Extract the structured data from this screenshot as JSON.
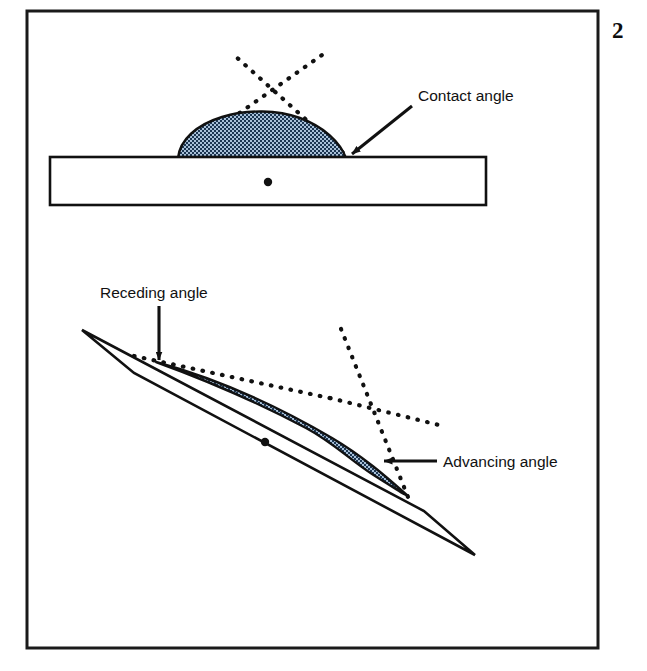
{
  "figure": {
    "number": "2",
    "frame": {
      "x": 27,
      "y": 11,
      "width": 571,
      "height": 637,
      "stroke_color": "#1a1a1a",
      "stroke_width": 3
    },
    "background_color": "#ffffff",
    "ink_color": "#111111"
  },
  "panels": [
    {
      "id": "panel-horizontal",
      "name": "horizontal-surface-panel",
      "description": "Liquid droplet resting on a horizontal flat solid slab",
      "slab": {
        "name": "horizontal-slab",
        "points": "50,157 486,157 486,205 50,205",
        "fill": "#ffffff",
        "stroke_color": "#111111",
        "stroke_width": 2.6
      },
      "center_dot": {
        "cx": 268,
        "cy": 182,
        "r": 4.2,
        "fill": "#111111"
      },
      "droplet": {
        "name": "sessile-droplet",
        "path": "M 178,157 C 180,140 196,125 222,117 C 248,109 278,110 300,118 C 324,127 340,142 346,157 Z",
        "fill_base": "#9fb9d4",
        "fill_dark": "#16314f",
        "stroke_color": "#111111",
        "stroke_width": 2.4
      },
      "tangent_lines": [
        {
          "name": "tangent-line-left",
          "x1": 174,
          "y1": 159,
          "x2": 322,
          "y2": 55,
          "style": "dotted"
        },
        {
          "name": "tangent-line-right",
          "x1": 350,
          "y1": 159,
          "x2": 234,
          "y2": 55,
          "style": "dotted"
        }
      ],
      "annotation": {
        "name": "contact-angle-annotation",
        "label": "Contact angle",
        "label_x": 418,
        "label_y": 101,
        "arrow": {
          "x1": 412,
          "y1": 106,
          "x2": 350,
          "y2": 156
        }
      }
    },
    {
      "id": "panel-inclined",
      "name": "inclined-surface-panel",
      "description": "Liquid droplet sliding on a tilted solid slab showing advancing and receding contact angles",
      "slab": {
        "name": "inclined-slab",
        "points": "82,330 134,370 475,555 424,511",
        "fill": "#ffffff",
        "stroke_color": "#111111",
        "stroke_width": 2.6,
        "tilt_degrees": -27
      },
      "center_dot": {
        "cx": 265,
        "cy": 442,
        "r": 4.2,
        "fill": "#111111"
      },
      "droplet": {
        "name": "sliding-droplet",
        "path": "M 158,363 C 210,381 262,404 300,422 C 330,437 348,456 372,471 C 388,481 398,487 406,492 C 392,480 368,459 336,440 C 292,414 226,381 158,363 Z",
        "fill_base": "#9fb9d4",
        "fill_dark": "#16314f",
        "stroke_color": "#111111",
        "stroke_width": 2.4
      },
      "tangent_lines": [
        {
          "name": "receding-tangent-line",
          "x1": 136,
          "y1": 356,
          "x2": 330,
          "y2": 398,
          "style": "dotted"
        },
        {
          "name": "advancing-tangent-line-upper",
          "x1": 340,
          "y1": 330,
          "x2": 407,
          "y2": 495,
          "style": "dotted"
        },
        {
          "name": "advancing-tangent-line-lower",
          "x1": 330,
          "y1": 398,
          "x2": 441,
          "y2": 425,
          "style": "dotted"
        }
      ],
      "annotations": [
        {
          "name": "receding-angle-annotation",
          "label": "Receding angle",
          "label_x": 100,
          "label_y": 298,
          "arrow": {
            "x1": 159,
            "y1": 306,
            "x2": 159,
            "y2": 358
          }
        },
        {
          "name": "advancing-angle-annotation",
          "label": "Advancing angle",
          "label_x": 443,
          "label_y": 467,
          "arrow": {
            "x1": 437,
            "y1": 461,
            "x2": 386,
            "y2": 461
          }
        }
      ]
    }
  ],
  "legend_terms": [
    "Contact angle",
    "Receding angle",
    "Advancing angle"
  ]
}
